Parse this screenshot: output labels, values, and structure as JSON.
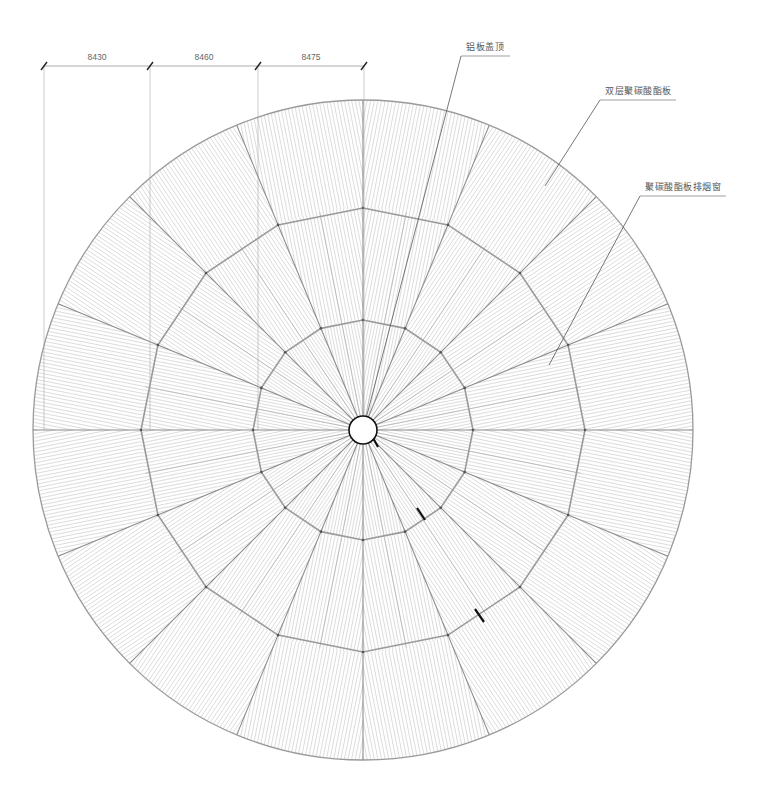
{
  "drawing": {
    "type": "circular roof plan",
    "center": [
      363,
      430
    ],
    "hub_radius": 14,
    "ring_radii": [
      110,
      222,
      330
    ],
    "segments": 16,
    "line_color": "#9a9a9a",
    "hatch_color": "#c4c4c4",
    "accent_color": "#111111"
  },
  "dimensions": {
    "line_y": 66,
    "ticks_x": [
      44,
      150,
      258,
      364
    ],
    "values": [
      "8430",
      "8460",
      "8475"
    ]
  },
  "annotations": [
    {
      "text": "铝板盖顶",
      "label_x": 466,
      "label_y": 40,
      "shelf": [
        461,
        56,
        510
      ],
      "target": [
        363,
        430
      ]
    },
    {
      "text": "双层聚碳酸酯板",
      "label_x": 605,
      "label_y": 84,
      "shelf": [
        600,
        100,
        676
      ],
      "target": [
        545,
        186
      ]
    },
    {
      "text": "聚碳酸酯板排烟窗",
      "label_x": 645,
      "label_y": 180,
      "shelf": [
        640,
        196,
        726
      ],
      "target": [
        549,
        365
      ]
    }
  ],
  "section_marks": [
    [
      [
        417,
        508
      ],
      [
        425,
        520
      ]
    ],
    [
      [
        475,
        609
      ],
      [
        484,
        622
      ]
    ],
    [
      [
        372,
        436
      ],
      [
        378,
        447
      ]
    ]
  ]
}
